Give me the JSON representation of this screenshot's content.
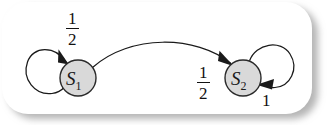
{
  "figure": {
    "type": "markov-chain-state-diagram",
    "background_color": "#ffffff",
    "card_color": "#ffffff",
    "node_fill": "#d9d9d9",
    "node_stroke": "#2a2a2a",
    "edge_color": "#1a1a1a"
  },
  "states": [
    {
      "id": "s1",
      "name": "S",
      "subscript": "1",
      "cx": 78,
      "cy": 78,
      "r": 18
    },
    {
      "id": "s2",
      "name": "S",
      "subscript": "2",
      "cx": 243,
      "cy": 78,
      "r": 18
    }
  ],
  "transitions": [
    {
      "id": "s1-self",
      "from": "s1",
      "to": "s1",
      "kind": "self-loop",
      "label_numerator": "1",
      "label_denominator": "2",
      "label_text": "1/2",
      "label_x": 66,
      "label_y": 10
    },
    {
      "id": "s1-to-s2",
      "from": "s1",
      "to": "s2",
      "kind": "arc",
      "label_numerator": "1",
      "label_denominator": "2",
      "label_text": "1/2",
      "label_x": 197,
      "label_y": 64
    },
    {
      "id": "s2-self",
      "from": "s2",
      "to": "s2",
      "kind": "self-loop",
      "label_numerator": "1",
      "label_denominator": null,
      "label_text": "1",
      "label_x": 262,
      "label_y": 92
    }
  ]
}
